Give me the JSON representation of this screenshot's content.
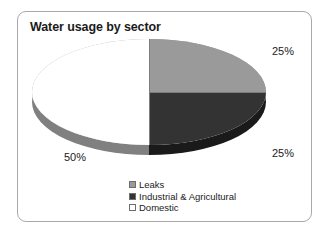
{
  "chart_data": {
    "type": "pie",
    "title": "Water usage by sector",
    "xlabel": "",
    "ylabel": "",
    "grid": false,
    "legend_position": "bottom",
    "style": "3d-pie",
    "categories": [
      "Leaks",
      "Industrial & Agricultural",
      "Domestic"
    ],
    "values": [
      25,
      25,
      50
    ],
    "value_labels": [
      "25%",
      "25%",
      "50%"
    ],
    "slices": [
      {
        "label": "Leaks",
        "value": 25,
        "value_label": "25%",
        "color": "#9a9a9a",
        "side_color": "#808080",
        "swatch_color": "#9a9a9a",
        "position": "upper-right"
      },
      {
        "label": "Industrial & Agricultural",
        "value": 25,
        "value_label": "25%",
        "color": "#333333",
        "side_color": "#1a1a1a",
        "swatch_color": "#333333",
        "position": "lower-right"
      },
      {
        "label": "Domestic",
        "value": 50,
        "value_label": "50%",
        "color": "#ffffff",
        "side_color": "#808080",
        "swatch_color": "#ffffff",
        "position": "left-half"
      }
    ],
    "units": "percent",
    "total": 100
  },
  "panel": {
    "border_color": "#a9a9a9",
    "background": "#ffffff"
  },
  "text_color": "#1b1b1b"
}
